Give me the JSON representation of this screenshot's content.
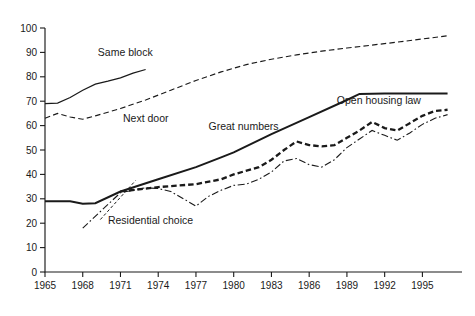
{
  "chart_data": {
    "type": "line",
    "title": "",
    "subtitle": "",
    "xlabel": "",
    "ylabel": "",
    "xlim": [
      1965,
      1997
    ],
    "ylim": [
      0,
      100
    ],
    "grid": false,
    "legend_position": "inline-annotations",
    "x_ticks": [
      "1965",
      "1968",
      "1971",
      "1974",
      "1977",
      "1980",
      "1983",
      "1986",
      "1989",
      "1992",
      "1995"
    ],
    "x_tick_values": [
      1965,
      1968,
      1971,
      1974,
      1977,
      1980,
      1983,
      1986,
      1989,
      1992,
      1995
    ],
    "y_ticks": [
      "0",
      "10",
      "20",
      "30",
      "40",
      "50",
      "60",
      "70",
      "80",
      "90",
      "100"
    ],
    "y_tick_values": [
      0,
      10,
      20,
      30,
      40,
      50,
      60,
      70,
      80,
      90,
      100
    ],
    "series": [
      {
        "name": "Same block",
        "style": "solid-thin",
        "label_x": 1969.2,
        "label_y": 88.5,
        "points": [
          [
            1965,
            69.0
          ],
          [
            1966,
            69.2
          ],
          [
            1967,
            71.5
          ],
          [
            1968,
            74.5
          ],
          [
            1969,
            77.0
          ],
          [
            1970,
            78.2
          ],
          [
            1971,
            79.6
          ],
          [
            1972,
            81.5
          ],
          [
            1973,
            83.0
          ]
        ]
      },
      {
        "name": "Next door",
        "style": "dashed",
        "label_x": 1971.2,
        "label_y": 61.5,
        "points": [
          [
            1965,
            63.0
          ],
          [
            1966,
            65.0
          ],
          [
            1967,
            63.5
          ],
          [
            1968,
            62.6
          ],
          [
            1969,
            64.0
          ],
          [
            1970,
            65.5
          ],
          [
            1971,
            67.0
          ],
          [
            1973,
            70.5
          ],
          [
            1975,
            74.5
          ],
          [
            1977,
            78.5
          ],
          [
            1979,
            82.0
          ],
          [
            1981,
            85.0
          ],
          [
            1983,
            87.2
          ],
          [
            1985,
            89.0
          ],
          [
            1987,
            90.5
          ],
          [
            1989,
            91.8
          ],
          [
            1991,
            93.0
          ],
          [
            1993,
            94.2
          ],
          [
            1995,
            95.5
          ],
          [
            1997,
            96.8
          ]
        ]
      },
      {
        "name": "Great numbers",
        "style": "solid-thick",
        "label_x": 1978.0,
        "label_y": 58.0,
        "points": [
          [
            1965,
            29.0
          ],
          [
            1967,
            29.0
          ],
          [
            1968,
            28.0
          ],
          [
            1969,
            28.2
          ],
          [
            1971,
            33.0
          ],
          [
            1974,
            38.0
          ],
          [
            1977,
            43.0
          ],
          [
            1979,
            47.0
          ],
          [
            1980,
            49.0
          ],
          [
            1983,
            56.5
          ],
          [
            1986,
            63.5
          ],
          [
            1989,
            70.5
          ],
          [
            1990,
            73.0
          ],
          [
            1992,
            73.2
          ],
          [
            1995,
            73.2
          ],
          [
            1997,
            73.2
          ]
        ]
      },
      {
        "name": "Open housing law",
        "style": "annotation-for-great-numbers",
        "label_x": 1988.2,
        "label_y": 69.0,
        "points": []
      },
      {
        "name": "Residential choice",
        "style": "dash-dot",
        "label_x": 1970.0,
        "label_y": 19.5,
        "points": [
          [
            1968,
            18.0
          ],
          [
            1971,
            32.5
          ],
          [
            1973,
            34.5
          ],
          [
            1974,
            34.2
          ],
          [
            1975,
            33.0
          ],
          [
            1976,
            30.0
          ],
          [
            1977,
            27.0
          ],
          [
            1978,
            31.0
          ],
          [
            1979,
            33.5
          ],
          [
            1980,
            35.5
          ],
          [
            1981,
            36.0
          ],
          [
            1982,
            38.0
          ],
          [
            1983,
            41.0
          ],
          [
            1984,
            45.5
          ],
          [
            1985,
            46.5
          ],
          [
            1986,
            44.0
          ],
          [
            1987,
            43.0
          ],
          [
            1988,
            46.0
          ],
          [
            1989,
            51.0
          ],
          [
            1990,
            54.5
          ],
          [
            1991,
            58.0
          ],
          [
            1992,
            56.0
          ],
          [
            1993,
            54.0
          ],
          [
            1994,
            57.0
          ],
          [
            1995,
            60.5
          ],
          [
            1996,
            63.0
          ],
          [
            1997,
            64.5
          ]
        ]
      },
      {
        "name": "unlabeled-heavy-dashed",
        "style": "heavy-dashed",
        "label_x": null,
        "label_y": null,
        "points": [
          [
            1971,
            33.0
          ],
          [
            1974,
            34.8
          ],
          [
            1977,
            36.0
          ],
          [
            1979,
            38.0
          ],
          [
            1980,
            40.0
          ],
          [
            1982,
            43.0
          ],
          [
            1983,
            46.0
          ],
          [
            1984,
            50.0
          ],
          [
            1985,
            53.5
          ],
          [
            1986,
            52.0
          ],
          [
            1987,
            51.5
          ],
          [
            1988,
            52.0
          ],
          [
            1989,
            55.0
          ],
          [
            1990,
            58.0
          ],
          [
            1991,
            61.5
          ],
          [
            1992,
            59.0
          ],
          [
            1993,
            58.0
          ],
          [
            1994,
            61.0
          ],
          [
            1995,
            64.0
          ],
          [
            1996,
            66.0
          ],
          [
            1997,
            66.5
          ]
        ]
      }
    ],
    "annotations": [
      {
        "name": "residential-choice-leader",
        "from": [
          1969.4,
          21.5
        ],
        "to": [
          1972.2,
          37.5
        ]
      }
    ]
  }
}
